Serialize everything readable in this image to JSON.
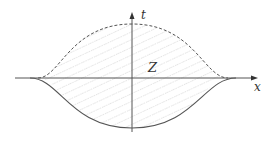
{
  "diagram": {
    "axes": {
      "x_label": "x",
      "t_label": "t"
    },
    "region_label": "Z",
    "curves": [
      {
        "name": "upper-boundary",
        "style": "dashed",
        "description": "bell-shaped curve above x-axis"
      },
      {
        "name": "lower-boundary",
        "style": "solid",
        "description": "inverted bell-shaped curve below x-axis"
      }
    ],
    "fill": "diagonal hatching",
    "colors": {
      "axis": "#555555",
      "curve": "#555555",
      "hatch": "#bbbbbb"
    }
  }
}
